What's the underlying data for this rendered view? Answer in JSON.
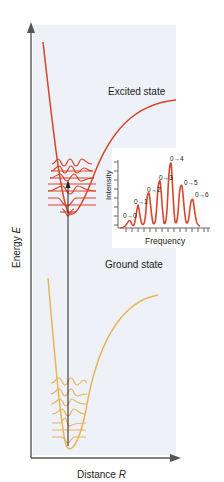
{
  "axes": {
    "y_label": "Energy",
    "y_symbol": "E",
    "x_label": "Distance",
    "x_symbol": "R"
  },
  "curves": {
    "excited": {
      "label": "Excited state",
      "color": "#d9452b"
    },
    "ground": {
      "label": "Ground state",
      "color": "#e8b45a"
    }
  },
  "inset": {
    "y_label": "Intensity",
    "x_label": "Frequency",
    "line_color": "#d9452b",
    "transitions": [
      "0→0",
      "0→1",
      "0→2",
      "0→3",
      "0→4",
      "0→5",
      "0→6"
    ],
    "peak_heights": [
      0.12,
      0.38,
      0.6,
      0.78,
      1.0,
      0.7,
      0.5
    ]
  },
  "colors": {
    "panel_bg": "#eef2f8",
    "axis": "#555555",
    "transition_arrow": "#222222"
  }
}
